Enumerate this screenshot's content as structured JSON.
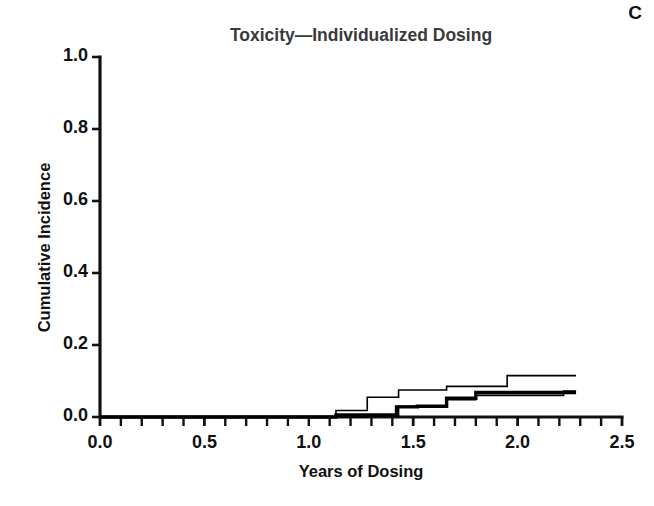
{
  "panel": {
    "label": "C"
  },
  "chart_data": {
    "type": "line",
    "subtype": "step",
    "title": "Toxicity—Individualized Dosing",
    "xlabel": "Years of Dosing",
    "ylabel": "Cumulative Incidence",
    "xlim": [
      0.0,
      2.5
    ],
    "ylim": [
      0.0,
      1.0
    ],
    "xticks": [
      0.0,
      0.5,
      1.0,
      1.5,
      2.0,
      2.5
    ],
    "xtick_labels": [
      "0.0",
      "0.5",
      "1.0",
      "1.5",
      "2.0",
      "2.5"
    ],
    "yticks": [
      0.0,
      0.2,
      0.4,
      0.6,
      0.8,
      1.0
    ],
    "ytick_labels": [
      "0.0",
      "0.2",
      "0.4",
      "0.6",
      "0.8",
      "1.0"
    ],
    "x_minor_tick_interval": 0.1,
    "grid": false,
    "legend": null,
    "legend_position": "none",
    "annotations": [
      "C"
    ],
    "series": [
      {
        "name": "Curve 1 (upper, thin)",
        "style": "thin",
        "color": "#000000",
        "line_width": 1.6,
        "x": [
          0.0,
          1.13,
          1.13,
          1.28,
          1.28,
          1.43,
          1.43,
          1.66,
          1.66,
          1.95,
          1.95,
          2.28
        ],
        "y": [
          0.0,
          0.0,
          0.018,
          0.018,
          0.055,
          0.055,
          0.075,
          0.075,
          0.085,
          0.085,
          0.115,
          0.115
        ],
        "steps": [
          {
            "x": 1.13,
            "y": 0.018
          },
          {
            "x": 1.28,
            "y": 0.055
          },
          {
            "x": 1.43,
            "y": 0.075
          },
          {
            "x": 1.66,
            "y": 0.085
          },
          {
            "x": 1.95,
            "y": 0.115
          },
          {
            "x": 2.28,
            "y": 0.115
          }
        ]
      },
      {
        "name": "Curve 2 (middle, thick)",
        "style": "thick",
        "color": "#000000",
        "line_width": 3.4,
        "x": [
          0.0,
          1.13,
          1.13,
          1.42,
          1.42,
          1.52,
          1.52,
          1.66,
          1.66,
          1.8,
          1.8,
          2.28
        ],
        "y": [
          0.0,
          0.0,
          0.006,
          0.006,
          0.028,
          0.028,
          0.03,
          0.03,
          0.052,
          0.052,
          0.068,
          0.068
        ],
        "steps": [
          {
            "x": 1.13,
            "y": 0.006
          },
          {
            "x": 1.42,
            "y": 0.028
          },
          {
            "x": 1.52,
            "y": 0.03
          },
          {
            "x": 1.66,
            "y": 0.052
          },
          {
            "x": 1.8,
            "y": 0.068
          },
          {
            "x": 2.28,
            "y": 0.068
          }
        ]
      },
      {
        "name": "Curve 3 (lower, thin)",
        "style": "thin",
        "color": "#000000",
        "line_width": 1.6,
        "x": [
          0.0,
          1.28,
          1.28,
          1.43,
          1.43,
          1.52,
          1.52,
          1.66,
          1.66,
          1.8,
          1.8,
          2.22,
          2.22,
          2.28
        ],
        "y": [
          0.0,
          0.0,
          0.002,
          0.002,
          0.03,
          0.03,
          0.03,
          0.03,
          0.048,
          0.048,
          0.06,
          0.06,
          0.072,
          0.072
        ],
        "steps": [
          {
            "x": 1.28,
            "y": 0.002
          },
          {
            "x": 1.43,
            "y": 0.03
          },
          {
            "x": 1.66,
            "y": 0.048
          },
          {
            "x": 1.8,
            "y": 0.06
          },
          {
            "x": 2.22,
            "y": 0.072
          },
          {
            "x": 2.28,
            "y": 0.072
          }
        ]
      }
    ]
  }
}
